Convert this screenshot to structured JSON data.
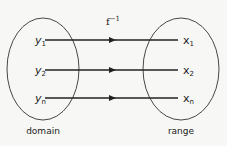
{
  "diagram": {
    "function_label": "f",
    "function_superscript": "−1",
    "domain": {
      "caption": "domain",
      "elements": [
        {
          "base": "y",
          "sub": "1"
        },
        {
          "base": "y",
          "sub": "2"
        },
        {
          "base": "y",
          "sub": "n"
        }
      ]
    },
    "range": {
      "caption": "range",
      "elements": [
        {
          "base": "x",
          "sub": "1"
        },
        {
          "base": "x",
          "sub": "2"
        },
        {
          "base": "x",
          "sub": "n"
        }
      ]
    },
    "mappings": [
      {
        "from": "y1",
        "to": "x1"
      },
      {
        "from": "y2",
        "to": "x2"
      },
      {
        "from": "yn",
        "to": "xn"
      }
    ],
    "colors": {
      "background": "#f7f7f5",
      "stroke": "#222222"
    }
  }
}
